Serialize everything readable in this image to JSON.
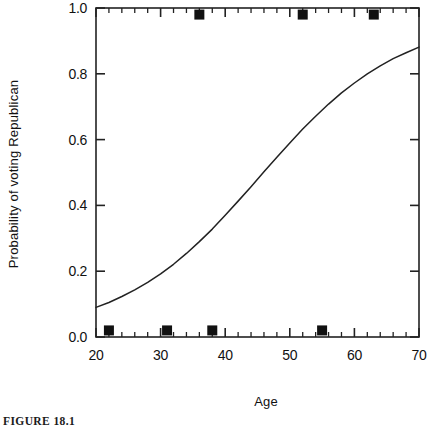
{
  "figure": {
    "caption": "FIGURE 18.1"
  },
  "chart_data": {
    "type": "scatter",
    "title": "",
    "subtitle": "",
    "xlabel": "Age",
    "ylabel": "Probability of voting Republican",
    "xlim": [
      20,
      70
    ],
    "ylim": [
      0.0,
      1.0
    ],
    "x_ticks": [
      20,
      30,
      40,
      50,
      60,
      70
    ],
    "x_tick_labels": [
      "20",
      "30",
      "40",
      "50",
      "60",
      "70"
    ],
    "y_ticks": [
      0.0,
      0.2,
      0.4,
      0.6,
      0.8,
      1.0
    ],
    "y_tick_labels": [
      "0.0",
      "0.2",
      "0.4",
      "0.6",
      "0.8",
      "1.0"
    ],
    "x_minor_tick_step": 2,
    "y_minor_tick_step": 0.05,
    "grid": false,
    "legend": null,
    "frame": "box",
    "tick_direction": "in",
    "marker_color": "#111111",
    "line_color": "#222222",
    "background_color": "#ffffff",
    "series": [
      {
        "name": "Observed votes",
        "type": "scatter",
        "marker": "square",
        "points": [
          {
            "x": 22,
            "y": 0.02
          },
          {
            "x": 31,
            "y": 0.02
          },
          {
            "x": 38,
            "y": 0.02
          },
          {
            "x": 55,
            "y": 0.02
          },
          {
            "x": 36,
            "y": 0.98
          },
          {
            "x": 52,
            "y": 0.98
          },
          {
            "x": 63,
            "y": 0.98
          }
        ]
      },
      {
        "name": "Fitted logistic curve",
        "type": "line",
        "model": "logistic",
        "midpoint_age": 47,
        "slope": 0.085,
        "x": [
          20,
          22,
          24,
          26,
          28,
          30,
          32,
          34,
          36,
          38,
          40,
          42,
          44,
          46,
          48,
          50,
          52,
          54,
          56,
          58,
          60,
          62,
          64,
          66,
          68,
          70
        ],
        "y": [
          0.09,
          0.105,
          0.123,
          0.143,
          0.166,
          0.192,
          0.221,
          0.254,
          0.29,
          0.328,
          0.37,
          0.413,
          0.457,
          0.502,
          0.546,
          0.59,
          0.632,
          0.671,
          0.708,
          0.742,
          0.772,
          0.8,
          0.824,
          0.846,
          0.864,
          0.881
        ]
      }
    ]
  }
}
